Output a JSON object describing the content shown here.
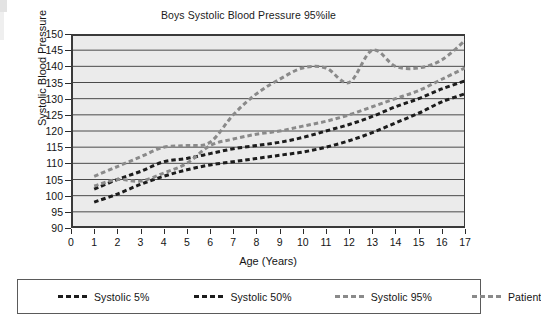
{
  "chart_data": {
    "type": "line",
    "title": "Boys Systolic Blood Pressure 95%ile",
    "xlabel": "Age (Years)",
    "ylabel": "Systolic Blood Pressure",
    "xlim": [
      0,
      17
    ],
    "ylim": [
      90,
      150
    ],
    "xticks": [
      0,
      1,
      2,
      3,
      4,
      5,
      6,
      7,
      8,
      9,
      10,
      11,
      12,
      13,
      14,
      15,
      16,
      17
    ],
    "yticks": [
      90,
      95,
      100,
      105,
      110,
      115,
      120,
      125,
      130,
      135,
      140,
      145,
      150
    ],
    "grid": "horizontal",
    "legend_position": "bottom",
    "x": [
      1,
      2,
      3,
      4,
      5,
      6,
      7,
      8,
      9,
      10,
      11,
      12,
      13,
      14,
      15,
      16,
      17
    ],
    "series": [
      {
        "name": "Systolic 5%",
        "color": "#1c1c1c",
        "style": "dashed",
        "width": 3,
        "values": [
          98,
          100.5,
          103.5,
          106,
          108,
          109.5,
          110.5,
          111.5,
          112.5,
          113.5,
          115,
          117,
          119.5,
          122.5,
          125.5,
          129,
          131.5
        ]
      },
      {
        "name": "Systolic 50%",
        "color": "#1c1c1c",
        "style": "dashed",
        "width": 3,
        "values": [
          102,
          105,
          107.5,
          110.5,
          111.5,
          113,
          114.5,
          115.5,
          116.5,
          118,
          120,
          122,
          124.5,
          127.5,
          130,
          133,
          135.5
        ]
      },
      {
        "name": "Systolic 95%",
        "color": "#8a8a8a",
        "style": "dashed",
        "width": 3,
        "values": [
          103,
          105,
          104.5,
          107,
          110,
          115.5,
          117.5,
          119,
          120,
          121.5,
          123,
          125,
          127.5,
          130,
          132.5,
          136,
          139.5
        ]
      },
      {
        "name": "Patient",
        "color": "#8a8a8a",
        "style": "dashed",
        "width": 3,
        "values": [
          106,
          109,
          112,
          115,
          115.5,
          116.5,
          125,
          131.5,
          136,
          139.5,
          139.5,
          135,
          145,
          140,
          139.5,
          142,
          148
        ]
      }
    ]
  },
  "chart": {
    "title": "Boys Systolic Blood Pressure 95%ile",
    "y_axis_label": "Systolic Blood Pressure",
    "x_axis_label": "Age (Years)"
  },
  "legend": {
    "items": [
      {
        "label": "Systolic 5%",
        "color": "#1c1c1c"
      },
      {
        "label": "Systolic 50%",
        "color": "#1c1c1c"
      },
      {
        "label": "Systolic 95%",
        "color": "#8a8a8a"
      },
      {
        "label": "Patient",
        "color": "#8a8a8a"
      }
    ]
  }
}
